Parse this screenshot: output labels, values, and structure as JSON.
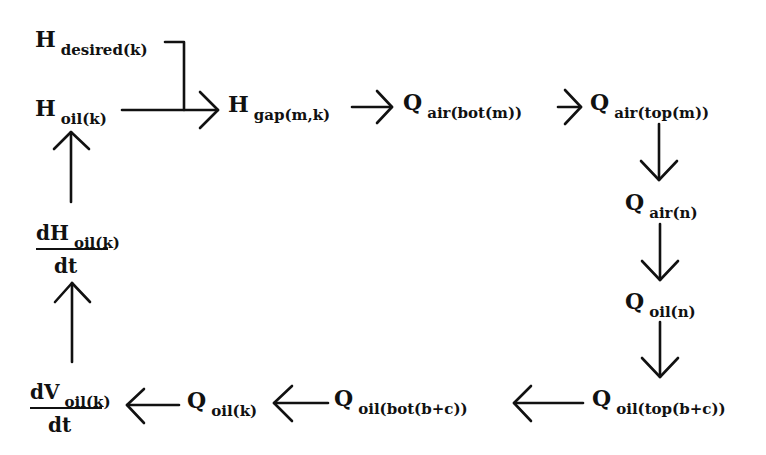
{
  "diagram": {
    "type": "flow-loop",
    "colors": {
      "ink": "#111111",
      "background": "#ffffff"
    },
    "nodes": {
      "h_desired": {
        "main": "H",
        "sub": "desired(k)"
      },
      "h_oil": {
        "main": "H",
        "sub": "oil(k)"
      },
      "h_gap": {
        "main": "H",
        "sub": "gap(m,k)"
      },
      "q_air_bot": {
        "main": "Q",
        "sub": "air(bot(m))"
      },
      "q_air_top": {
        "main": "Q",
        "sub": "air(top(m))"
      },
      "q_air_n": {
        "main": "Q",
        "sub": "air(n)"
      },
      "q_oil_n": {
        "main": "Q",
        "sub": "oil(n)"
      },
      "q_oil_top": {
        "main": "Q",
        "sub": "oil(top(b+c))"
      },
      "q_oil_bot": {
        "main": "Q",
        "sub": "oil(bot(b+c))"
      },
      "q_oil_k": {
        "main": "Q",
        "sub": "oil(k)"
      },
      "dv_dt": {
        "num_main": "dV",
        "num_sub": "oil(k)",
        "den": "dt"
      },
      "dh_dt": {
        "num_main": "dH",
        "num_sub": "oil(k)",
        "den": "dt"
      }
    },
    "edges": [
      {
        "from": "H desired(k)",
        "to": "H gap(m,k)",
        "style": "elbow"
      },
      {
        "from": "H oil(k)",
        "to": "H gap(m,k)"
      },
      {
        "from": "H gap(m,k)",
        "to": "Q air(bot(m))"
      },
      {
        "from": "Q air(bot(m))",
        "to": "Q air(top(m))"
      },
      {
        "from": "Q air(top(m))",
        "to": "Q air(n)"
      },
      {
        "from": "Q air(n)",
        "to": "Q oil(n)"
      },
      {
        "from": "Q oil(n)",
        "to": "Q oil(top(b+c))"
      },
      {
        "from": "Q oil(top(b+c))",
        "to": "Q oil(bot(b+c))"
      },
      {
        "from": "Q oil(bot(b+c))",
        "to": "Q oil(k)"
      },
      {
        "from": "Q oil(k)",
        "to": "dV oil(k)/dt"
      },
      {
        "from": "dV oil(k)/dt",
        "to": "dH oil(k)/dt"
      },
      {
        "from": "dH oil(k)/dt",
        "to": "H oil(k)"
      }
    ]
  }
}
